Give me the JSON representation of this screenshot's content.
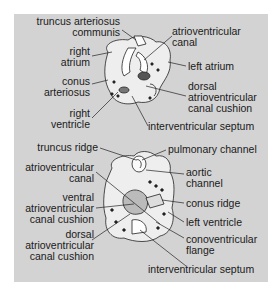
{
  "figure": {
    "top_diagram": {
      "labels": {
        "truncus_arteriosus_communis": [
          "truncus arteriosus",
          "communis"
        ],
        "right_atrium": [
          "right",
          "atrium"
        ],
        "conus_arteriosus": [
          "conus",
          "arteriosus"
        ],
        "right_ventricle": [
          "right",
          "ventricle"
        ],
        "atrioventricular_canal": [
          "atrioventricular",
          "canal"
        ],
        "left_atrium": [
          "left atrium"
        ],
        "dorsal_av_cushion": [
          "dorsal",
          "atrioventricular",
          "canal cushion"
        ],
        "interventricular_septum": [
          "interventricular septum"
        ]
      }
    },
    "bottom_diagram": {
      "labels": {
        "truncus_ridge": [
          "truncus ridge"
        ],
        "atrioventricular_canal": [
          "atrioventricular",
          "canal"
        ],
        "ventral_av_cushion": [
          "ventral",
          "atrioventricular",
          "canal cushion"
        ],
        "dorsal_av_cushion": [
          "dorsal",
          "atrioventricular",
          "canal cushion"
        ],
        "pulmonary_channel": [
          "pulmonary channel"
        ],
        "aortic_channel": [
          "aortic",
          "channel"
        ],
        "conus_ridge": [
          "conus ridge"
        ],
        "left_ventricle": [
          "left ventricle"
        ],
        "conoventricular_flange": [
          "conoventricular",
          "flange"
        ],
        "interventricular_septum": [
          "interventricular septum"
        ]
      }
    },
    "colors": {
      "panel": "#d3d3d3",
      "page": "#ffffff",
      "ink": "#1a1a1a",
      "tissue": "#f2f2f2"
    }
  }
}
